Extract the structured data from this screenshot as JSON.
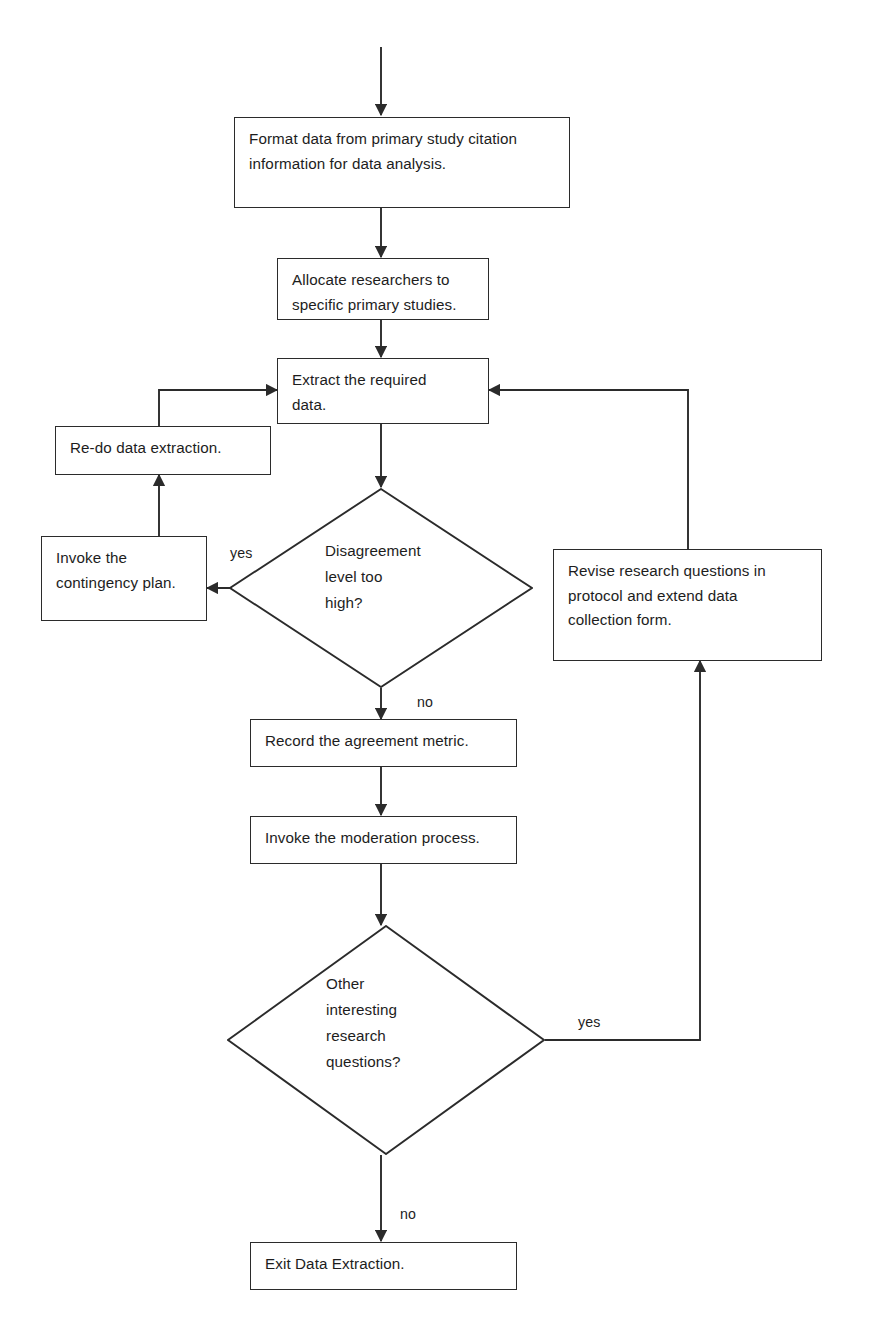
{
  "diagram": {
    "background_color": "#ffffff",
    "line_color": "#2b2b2b",
    "text_color": "#1d1d1d",
    "nodes": [
      {
        "id": "format-data",
        "type": "process",
        "text": "Format data from primary study citation\ninformation for data analysis."
      },
      {
        "id": "allocate-researchers",
        "type": "process",
        "text": "Allocate researchers to\nspecific primary studies."
      },
      {
        "id": "extract-data",
        "type": "process",
        "text": "Extract the required\ndata."
      },
      {
        "id": "redo-extraction",
        "type": "process",
        "text": "Re-do data extraction."
      },
      {
        "id": "contingency-plan",
        "type": "process",
        "text": "Invoke the\ncontingency plan."
      },
      {
        "id": "disagreement-level",
        "type": "decision",
        "text": "Disagreement\nlevel too\nhigh?"
      },
      {
        "id": "revise-questions",
        "type": "process",
        "text": "Revise research questions in\nprotocol and extend data\ncollection form."
      },
      {
        "id": "record-agreement",
        "type": "process",
        "text": "Record the agreement metric."
      },
      {
        "id": "moderation-process",
        "type": "process",
        "text": "Invoke the moderation process."
      },
      {
        "id": "other-questions",
        "type": "decision",
        "text": "Other\ninteresting\nresearch\nquestions?"
      },
      {
        "id": "exit-extraction",
        "type": "process",
        "text": "Exit Data Extraction."
      }
    ],
    "edge_labels": [
      {
        "id": "yes-disagreement",
        "text": "yes"
      },
      {
        "id": "no-disagreement",
        "text": "no"
      },
      {
        "id": "yes-other-questions",
        "text": "yes"
      },
      {
        "id": "no-other-questions",
        "text": "no"
      }
    ]
  }
}
